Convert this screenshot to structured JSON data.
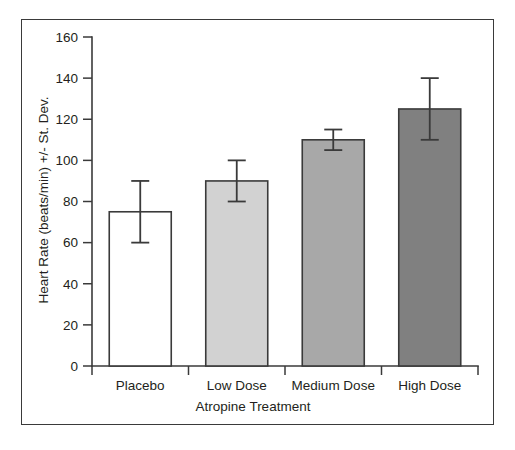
{
  "chart_data": {
    "type": "bar",
    "title": "",
    "xlabel": "Atropine Treatment",
    "ylabel": "Heart Rate (beats/min) +/- St. Dev.",
    "categories": [
      "Placebo",
      "Low Dose",
      "Medium Dose",
      "High Dose"
    ],
    "values": [
      75,
      90,
      110,
      125
    ],
    "errors": [
      15,
      10,
      5,
      15
    ],
    "error_type": "standard deviation",
    "bar_colors": [
      "#ffffff",
      "#d2d2d2",
      "#a8a8a8",
      "#808080"
    ],
    "bar_edge_color": "#3a3a3a",
    "ylim": [
      0,
      160
    ],
    "ytick_step": 20,
    "yticks": [
      0,
      20,
      40,
      60,
      80,
      100,
      120,
      140,
      160
    ],
    "ytick_labels": [
      "0",
      "20",
      "40",
      "60",
      "80",
      "100",
      "120",
      "140",
      "160"
    ],
    "grid": false,
    "legend": "none",
    "series": [
      {
        "name": "Heart Rate",
        "points": [
          {
            "category": "Placebo",
            "value": 75,
            "error": 15,
            "upper": 90,
            "lower": 60,
            "fill": "#ffffff"
          },
          {
            "category": "Low Dose",
            "value": 90,
            "error": 10,
            "upper": 100,
            "lower": 80,
            "fill": "#d2d2d2"
          },
          {
            "category": "Medium Dose",
            "value": 110,
            "error": 5,
            "upper": 115,
            "lower": 105,
            "fill": "#a8a8a8"
          },
          {
            "category": "High Dose",
            "value": 125,
            "error": 15,
            "upper": 140,
            "lower": 110,
            "fill": "#808080"
          }
        ]
      }
    ]
  },
  "figure": {
    "border_color": "#3a3a3a",
    "background": "#ffffff",
    "axis_color": "#3a3a3a",
    "text_color": "#231f20"
  }
}
